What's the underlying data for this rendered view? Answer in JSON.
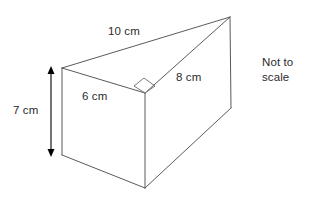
{
  "figure": {
    "name": "triangular-prism-diagram",
    "shape": "triangular prism",
    "note_line_1": "Not to",
    "note_line_2": "scale",
    "line_color": "#5b5b5b",
    "text_color": "#2b2b2b",
    "background": "#ffffff",
    "labels": {
      "top_edge": "10 cm",
      "slant_edge": "8 cm",
      "front_edge": "6 cm",
      "height": "7 cm"
    },
    "measurements": [
      {
        "id": "top-edge",
        "value": "10 cm",
        "number": 10,
        "unit": "cm"
      },
      {
        "id": "slant-edge",
        "value": "8 cm",
        "number": 8,
        "unit": "cm"
      },
      {
        "id": "front-edge",
        "value": "6 cm",
        "number": 6,
        "unit": "cm"
      },
      {
        "id": "height",
        "value": "7 cm",
        "number": 7,
        "unit": "cm"
      }
    ],
    "annotations": {
      "right_angle_marker": "right-angle",
      "height_dimension": "double-headed vertical arrow"
    }
  }
}
